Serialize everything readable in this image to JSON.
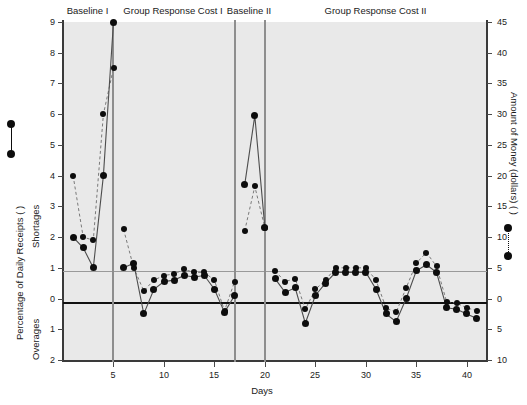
{
  "chart_data": {
    "type": "line",
    "title": "",
    "xlabel": "Days",
    "ylabel_left": "Percentage of Daily Receipts (        )",
    "ylabel_left_upper": "Shortages",
    "ylabel_left_lower": "Overages",
    "ylabel_right": "Amount of Money (dollars) (        )",
    "xlim": [
      0,
      42
    ],
    "xticks": [
      5,
      10,
      15,
      20,
      25,
      30,
      35,
      40
    ],
    "xtick_labels": [
      "5",
      "10",
      "15",
      "20",
      "25",
      "30",
      "35",
      "40"
    ],
    "yticks_left": [
      9,
      8,
      7,
      6,
      5,
      4,
      3,
      2,
      1,
      0,
      -1,
      -2
    ],
    "ytick_labels_left": [
      "9",
      "8",
      "7",
      "6",
      "5",
      "4",
      "3",
      "2",
      "1",
      "0",
      "1",
      "2"
    ],
    "yticks_right": [
      45,
      40,
      35,
      30,
      25,
      20,
      15,
      10,
      5,
      0,
      -5,
      -10
    ],
    "ytick_labels_right": [
      "45",
      "40",
      "35",
      "30",
      "25",
      "20",
      "15",
      "10",
      "5",
      "0",
      "5",
      "10"
    ],
    "ylim_left": [
      -2,
      9
    ],
    "grid": true,
    "gridlines_left": [
      1,
      0
    ],
    "zero_line": 0,
    "criterion_line": 1,
    "phases": [
      {
        "label": "Baseline I",
        "start_day": 1,
        "end_day": 5
      },
      {
        "label": "Group Response Cost I",
        "start_day": 6,
        "end_day": 17
      },
      {
        "label": "Baseline II",
        "start_day": 18,
        "end_day": 20
      },
      {
        "label": "Group Response Cost II",
        "start_day": 21,
        "end_day": 41
      }
    ],
    "phase_divider_days": [
      5.5,
      17.5,
      20.5
    ],
    "series": [
      {
        "name": "Percentage of Daily Receipts",
        "style": "solid",
        "x": [
          1,
          2,
          3,
          4,
          5,
          6,
          7,
          8,
          9,
          10,
          11,
          12,
          13,
          14,
          15,
          16,
          17,
          18,
          19,
          20,
          21,
          22,
          23,
          24,
          25,
          26,
          27,
          28,
          29,
          30,
          31,
          32,
          33,
          34,
          35,
          36,
          37,
          38,
          39,
          40,
          41
        ],
        "values": [
          2.0,
          1.65,
          1.0,
          4.0,
          9.0,
          1.0,
          1.15,
          -0.5,
          0.3,
          0.55,
          0.6,
          0.75,
          0.7,
          0.75,
          0.3,
          -0.45,
          0.1,
          3.7,
          5.95,
          2.3,
          0.65,
          0.2,
          0.35,
          -0.8,
          0.1,
          0.5,
          0.85,
          0.85,
          0.85,
          0.85,
          0.3,
          -0.5,
          -0.75,
          0.0,
          0.9,
          1.1,
          0.85,
          -0.3,
          -0.35,
          -0.5,
          -0.65
        ]
      },
      {
        "name": "Amount of Money (dollars)",
        "style": "dashed",
        "x": [
          1,
          2,
          3,
          4,
          5,
          6,
          7,
          8,
          9,
          10,
          11,
          12,
          13,
          14,
          15,
          16,
          17,
          18,
          19,
          20,
          21,
          22,
          23,
          24,
          25,
          26,
          27,
          28,
          29,
          30,
          31,
          32,
          33,
          34,
          35,
          36,
          37,
          38,
          39,
          40,
          41
        ],
        "values": [
          4.0,
          2.0,
          1.9,
          6.0,
          7.5,
          2.25,
          1.0,
          0.25,
          0.6,
          0.75,
          0.8,
          0.95,
          0.85,
          0.85,
          0.6,
          -0.4,
          0.55,
          2.2,
          3.65,
          2.3,
          0.9,
          0.55,
          0.65,
          -0.35,
          0.3,
          0.6,
          1.0,
          1.0,
          1.0,
          1.0,
          0.6,
          -0.3,
          -0.45,
          0.35,
          1.15,
          1.5,
          1.05,
          -0.1,
          -0.15,
          -0.3,
          -0.4
        ]
      }
    ],
    "legend": [
      {
        "label": "left-axis-marker",
        "style": "solid",
        "position": "outside-left"
      },
      {
        "label": "right-axis-marker",
        "style": "dotted",
        "position": "outside-right"
      }
    ]
  }
}
